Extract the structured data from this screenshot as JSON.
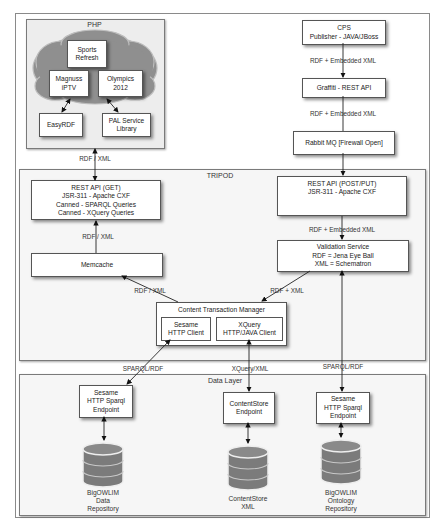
{
  "diagram": {
    "colors": {
      "cloud_fill": "#8f8f8f",
      "cloud_edge": "#bdbdbd",
      "panel_bg": "#f6f6f6",
      "box_border": "#555555",
      "db_fill": "#7b7b7b",
      "db_band": "#c8c8c8"
    },
    "php": {
      "title": "PHP",
      "cloud_items": [
        {
          "line1": "Sports",
          "line2": "Refresh"
        },
        {
          "line1": "Magnuss",
          "line2": "iPTV"
        },
        {
          "line1": "Olympics",
          "line2": "2012"
        }
      ],
      "libs": [
        {
          "line1": "EasyRDF",
          "line2": ""
        },
        {
          "line1": "PAL Service",
          "line2": "Library"
        }
      ]
    },
    "publisher_chain": {
      "cps": {
        "line1": "CPS",
        "line2": "Publisher - JAVA/JBoss"
      },
      "edge1": "RDF + Embedded XML",
      "graffiti": "Graffiti - REST API",
      "edge2": "RDF + Embedded XML",
      "rabbit": "Rabbit MQ [Firewall Open]"
    },
    "edge_php_tripod": "RDF / XML",
    "tripod": {
      "title": "TRIPOD",
      "rest_get": {
        "line1": "REST API (GET)",
        "line2": "JSR-311 - Apache CXF",
        "line3": "Canned - SPARQL Queries",
        "line4": "Canned - XQuery Queries"
      },
      "edge_get_memcache": "RDF / XML",
      "memcache": "Memcache",
      "rest_post": {
        "line1": "REST API (POST/PUT)",
        "line2": "JSR-311 - Apache CXF"
      },
      "edge_post_validation": "RDF + Embedded XML",
      "validation": {
        "line1": "Validation Service",
        "line2": "RDF = Jena Eye Ball",
        "line3": "XML = Schematron"
      },
      "edge_memcache_ctm": "RDF / XML",
      "edge_validation_ctm": "RDF + XML",
      "ctm": {
        "title": "Content Transaction Manager",
        "sesame_client": {
          "line1": "Sesame",
          "line2": "HTTP Client"
        },
        "xquery_client": {
          "line1": "XQuery",
          "line2": "HTTP/JAVA Client"
        }
      }
    },
    "edge_sparql_left": "SPARQL/RDF",
    "edge_xquery": "XQuery/XML",
    "edge_sparql_right": "SPARQL/RDF",
    "data_layer": {
      "title": "Data Layer",
      "endpoints": [
        {
          "line1": "Sesame",
          "line2": "HTTP Sparql",
          "line3": "Endpoint"
        },
        {
          "line1": "ContentStore",
          "line2": "Endpoint",
          "line3": ""
        },
        {
          "line1": "Sesame",
          "line2": "HTTP Sparql",
          "line3": "Endpoint"
        }
      ],
      "databases": [
        {
          "line1": "BigOWLIM",
          "line2": "Data",
          "line3": "Repository",
          "icon": "database-icon"
        },
        {
          "line1": "ContentStore",
          "line2": "XML",
          "line3": "",
          "icon": "database-icon"
        },
        {
          "line1": "BigOWLIM",
          "line2": "Ontology",
          "line3": "Repository",
          "icon": "database-icon"
        }
      ]
    }
  }
}
